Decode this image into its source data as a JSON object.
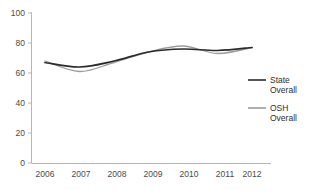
{
  "chart_data": {
    "type": "line",
    "title": "",
    "xlabel": "",
    "ylabel": "",
    "categories": [
      "2006",
      "2007",
      "2008",
      "2009",
      "2010",
      "2011",
      "2012"
    ],
    "x": [
      2006,
      2007,
      2008,
      2009,
      2010,
      2011,
      2012
    ],
    "ylim": [
      0,
      100
    ],
    "yticks": [
      0,
      20,
      40,
      60,
      80,
      100
    ],
    "ytick_labels": [
      "0",
      "20",
      "40",
      "60",
      "80",
      "100"
    ],
    "grid": false,
    "legend_position": "right",
    "series": [
      {
        "name": "State Overall",
        "color": "#2b2b2b",
        "values": [
          67,
          64,
          68,
          74,
          76,
          75,
          77
        ]
      },
      {
        "name": "OSH Overall",
        "color": "#9b9b9b",
        "values": [
          68,
          61,
          67,
          74,
          78,
          73,
          77
        ]
      }
    ]
  },
  "axes": {
    "y_tick_labels": [
      "100",
      "80",
      "60",
      "40",
      "20",
      "0"
    ],
    "x_tick_labels": [
      "2006",
      "2007",
      "2008",
      "2009",
      "2010",
      "2011",
      "2012"
    ]
  },
  "legend": {
    "items": [
      {
        "line1": "State",
        "line2": "Overall",
        "color": "#2b2b2b"
      },
      {
        "line1": "OSH",
        "line2": "Overall",
        "color": "#9b9b9b"
      }
    ]
  }
}
